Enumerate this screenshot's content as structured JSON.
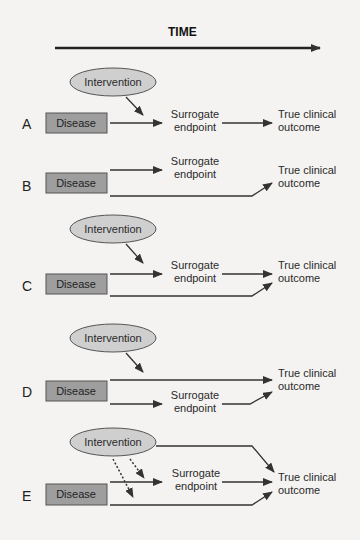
{
  "title": "TIME",
  "labels": {
    "disease": "Disease",
    "intervention": "Intervention",
    "surrogate_line1": "Surrogate",
    "surrogate_line2": "endpoint",
    "outcome_line1": "True clinical",
    "outcome_line2": "outcome"
  },
  "rows": [
    {
      "letter": "A",
      "description": "Intervention acts on causal pathway Disease -> Surrogate endpoint -> True clinical outcome"
    },
    {
      "letter": "B",
      "description": "Surrogate endpoint not in causal pathway; Disease leads separately to true clinical outcome"
    },
    {
      "letter": "C",
      "description": "Intervention acts on surrogate pathway, but disease also affects outcome via independent pathway"
    },
    {
      "letter": "D",
      "description": "Intervention acts on pathway bypassing the surrogate endpoint"
    },
    {
      "letter": "E",
      "description": "Intervention has unintended effects (dashed) and direct effect on outcome"
    }
  ],
  "colors": {
    "background": "#f4f3f1",
    "disease_fill": "#9e9e9e",
    "disease_stroke": "#555555",
    "intervention_fill": "#cfcfcf",
    "intervention_stroke": "#555555",
    "arrow": "#333333"
  }
}
